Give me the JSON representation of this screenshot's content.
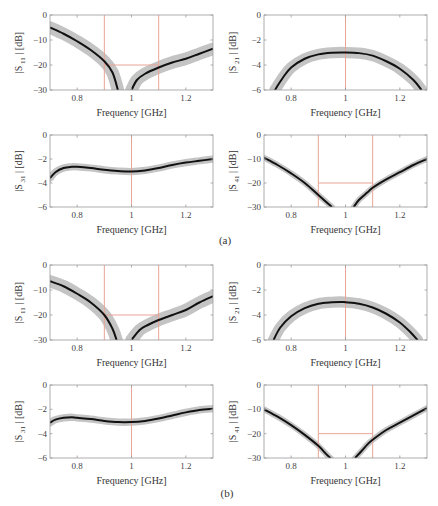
{
  "figure": {
    "panel_labels": [
      "(a)",
      "(b)"
    ],
    "colors": {
      "mean_line": "#111111",
      "band": "#c4c4c4",
      "spec": "#e9a597",
      "axis": "#9a9a9a",
      "tick_text": "#444444"
    }
  },
  "chart_data": [
    {
      "type": "line",
      "panel": "(a)",
      "position": "top-left",
      "ylabel_main": "|S",
      "ylabel_sub": "11",
      "ylabel_unit": "| [dB]",
      "xlabel": "Frequency [GHz]",
      "xlim": [
        0.7,
        1.3
      ],
      "ylim": [
        -30,
        0
      ],
      "xticks": [
        0.8,
        1,
        1.2
      ],
      "yticks": [
        0,
        -10,
        -20,
        -30
      ],
      "spec_lines": {
        "vertical": [
          0.9,
          1.1
        ],
        "horizontal": {
          "y": -20,
          "x0": 0.9,
          "x1": 1.1
        }
      },
      "series": [
        {
          "name": "mean",
          "x": [
            0.7,
            0.75,
            0.8,
            0.85,
            0.9,
            0.93,
            0.95
          ],
          "y": [
            -5,
            -7.5,
            -10.5,
            -14,
            -18.5,
            -23,
            -30
          ]
        },
        {
          "name": "mean_right",
          "x": [
            1.0,
            1.02,
            1.05,
            1.1,
            1.15,
            1.2,
            1.25,
            1.3
          ],
          "y": [
            -30,
            -26,
            -23.5,
            -21,
            -19,
            -17.5,
            -15.5,
            -13.5
          ]
        }
      ],
      "band_width": 2.5
    },
    {
      "type": "line",
      "panel": "(a)",
      "position": "top-right",
      "ylabel_main": "|S",
      "ylabel_sub": "21",
      "ylabel_unit": "| [dB]",
      "xlabel": "Frequency [GHz]",
      "xlim": [
        0.7,
        1.3
      ],
      "ylim": [
        -6,
        0
      ],
      "xticks": [
        0.8,
        1,
        1.2
      ],
      "yticks": [
        0,
        -2,
        -4,
        -6
      ],
      "spec_lines": {
        "vertical": [
          1.0
        ]
      },
      "series": [
        {
          "name": "mean",
          "x": [
            0.74,
            0.77,
            0.8,
            0.85,
            0.9,
            0.95,
            1.0,
            1.05,
            1.1,
            1.15,
            1.2,
            1.25,
            1.28
          ],
          "y": [
            -6,
            -5,
            -4.2,
            -3.5,
            -3.15,
            -3.02,
            -3.0,
            -3.05,
            -3.25,
            -3.7,
            -4.3,
            -5.2,
            -6
          ]
        }
      ],
      "band_width": 0.45
    },
    {
      "type": "line",
      "panel": "(a)",
      "position": "bottom-left",
      "ylabel_main": "|S",
      "ylabel_sub": "31",
      "ylabel_unit": "| [dB]",
      "xlabel": "Frequency [GHz]",
      "xlim": [
        0.7,
        1.3
      ],
      "ylim": [
        -6,
        0
      ],
      "xticks": [
        0.8,
        1,
        1.2
      ],
      "yticks": [
        0,
        -2,
        -4,
        -6
      ],
      "spec_lines": {
        "vertical": [
          1.0
        ]
      },
      "series": [
        {
          "name": "mean",
          "x": [
            0.7,
            0.72,
            0.75,
            0.78,
            0.8,
            0.85,
            0.9,
            0.95,
            1.0,
            1.05,
            1.1,
            1.15,
            1.2,
            1.25,
            1.3
          ],
          "y": [
            -3.6,
            -3.1,
            -2.75,
            -2.65,
            -2.65,
            -2.75,
            -2.9,
            -3.0,
            -3.05,
            -2.95,
            -2.75,
            -2.5,
            -2.3,
            -2.15,
            -2.0
          ]
        }
      ],
      "band_width": 0.3
    },
    {
      "type": "line",
      "panel": "(a)",
      "position": "bottom-right",
      "ylabel_main": "|S",
      "ylabel_sub": "41",
      "ylabel_unit": "| [dB]",
      "xlabel": "Frequency [GHz]",
      "xlim": [
        0.7,
        1.3
      ],
      "ylim": [
        -30,
        0
      ],
      "xticks": [
        0.8,
        1,
        1.2
      ],
      "yticks": [
        0,
        -10,
        -20,
        -30
      ],
      "spec_lines": {
        "vertical": [
          0.9,
          1.1
        ],
        "horizontal": {
          "y": -20,
          "x0": 0.9,
          "x1": 1.1
        }
      },
      "series": [
        {
          "name": "mean",
          "x": [
            0.7,
            0.75,
            0.8,
            0.85,
            0.9,
            0.93,
            0.95
          ],
          "y": [
            -9.5,
            -12.5,
            -16,
            -20,
            -25,
            -28,
            -30
          ]
        },
        {
          "name": "mean_right",
          "x": [
            1.03,
            1.05,
            1.08,
            1.1,
            1.15,
            1.2,
            1.25,
            1.3
          ],
          "y": [
            -30,
            -27,
            -24,
            -22,
            -18.5,
            -15.5,
            -12.5,
            -10
          ]
        }
      ],
      "band_width": 1.2
    },
    {
      "type": "line",
      "panel": "(b)",
      "position": "top-left",
      "ylabel_main": "|S",
      "ylabel_sub": "11",
      "ylabel_unit": "| [dB]",
      "xlabel": "Frequency [GHz]",
      "xlim": [
        0.7,
        1.3
      ],
      "ylim": [
        -30,
        0
      ],
      "xticks": [
        0.8,
        1,
        1.2
      ],
      "yticks": [
        0,
        -10,
        -20,
        -30
      ],
      "spec_lines": {
        "vertical": [
          0.9,
          1.1
        ],
        "horizontal": {
          "y": -20,
          "x0": 0.9,
          "x1": 1.1
        }
      },
      "series": [
        {
          "name": "mean",
          "x": [
            0.7,
            0.75,
            0.8,
            0.85,
            0.9,
            0.93,
            0.945
          ],
          "y": [
            -6.5,
            -8.5,
            -11.5,
            -15,
            -20,
            -25.5,
            -30
          ]
        },
        {
          "name": "mean_right",
          "x": [
            1.0,
            1.03,
            1.06,
            1.1,
            1.15,
            1.2,
            1.25,
            1.3
          ],
          "y": [
            -30,
            -26,
            -24,
            -22,
            -20,
            -18,
            -15,
            -12.5
          ]
        }
      ],
      "band_width": 2.5
    },
    {
      "type": "line",
      "panel": "(b)",
      "position": "top-right",
      "ylabel_main": "|S",
      "ylabel_sub": "21",
      "ylabel_unit": "| [dB]",
      "xlabel": "Frequency [GHz]",
      "xlim": [
        0.7,
        1.3
      ],
      "ylim": [
        -6,
        0
      ],
      "xticks": [
        0.8,
        1,
        1.2
      ],
      "yticks": [
        0,
        -2,
        -4,
        -6
      ],
      "spec_lines": {
        "vertical": [
          1.0
        ]
      },
      "series": [
        {
          "name": "mean",
          "x": [
            0.735,
            0.76,
            0.8,
            0.85,
            0.9,
            0.95,
            0.98,
            1.0,
            1.05,
            1.1,
            1.15,
            1.2,
            1.24,
            1.265
          ],
          "y": [
            -6,
            -5,
            -4.1,
            -3.45,
            -3.1,
            -2.98,
            -2.95,
            -2.98,
            -3.1,
            -3.4,
            -3.9,
            -4.6,
            -5.4,
            -6
          ]
        }
      ],
      "band_width": 0.45
    },
    {
      "type": "line",
      "panel": "(b)",
      "position": "bottom-left",
      "ylabel_main": "|S",
      "ylabel_sub": "31",
      "ylabel_unit": "| [dB]",
      "xlabel": "Frequency [GHz]",
      "xlim": [
        0.7,
        1.3
      ],
      "ylim": [
        -6,
        0
      ],
      "xticks": [
        0.8,
        1,
        1.2
      ],
      "yticks": [
        0,
        -2,
        -4,
        -6
      ],
      "spec_lines": {
        "vertical": [
          1.0
        ]
      },
      "series": [
        {
          "name": "mean",
          "x": [
            0.7,
            0.72,
            0.75,
            0.78,
            0.8,
            0.85,
            0.9,
            0.95,
            1.0,
            1.05,
            1.1,
            1.15,
            1.2,
            1.25,
            1.3
          ],
          "y": [
            -3.1,
            -2.85,
            -2.7,
            -2.65,
            -2.7,
            -2.8,
            -2.95,
            -3.05,
            -3.05,
            -2.95,
            -2.75,
            -2.5,
            -2.25,
            -2.05,
            -1.95
          ]
        }
      ],
      "band_width": 0.3
    },
    {
      "type": "line",
      "panel": "(b)",
      "position": "bottom-right",
      "ylabel_main": "|S",
      "ylabel_sub": "41",
      "ylabel_unit": "| [dB]",
      "xlabel": "Frequency [GHz]",
      "xlim": [
        0.7,
        1.3
      ],
      "ylim": [
        -30,
        0
      ],
      "xticks": [
        0.8,
        1,
        1.2
      ],
      "yticks": [
        0,
        -10,
        -20,
        -30
      ],
      "spec_lines": {
        "vertical": [
          0.9,
          1.1
        ],
        "horizontal": {
          "y": -20,
          "x0": 0.9,
          "x1": 1.1
        }
      },
      "series": [
        {
          "name": "mean",
          "x": [
            0.7,
            0.75,
            0.8,
            0.85,
            0.9,
            0.93,
            0.945
          ],
          "y": [
            -10,
            -13,
            -16.5,
            -20.5,
            -25,
            -28.5,
            -30
          ]
        },
        {
          "name": "mean_right",
          "x": [
            1.035,
            1.06,
            1.08,
            1.1,
            1.15,
            1.2,
            1.25,
            1.3
          ],
          "y": [
            -30,
            -27,
            -24.5,
            -22.5,
            -18.5,
            -15.5,
            -12.5,
            -9.5
          ]
        }
      ],
      "band_width": 1.2
    }
  ]
}
